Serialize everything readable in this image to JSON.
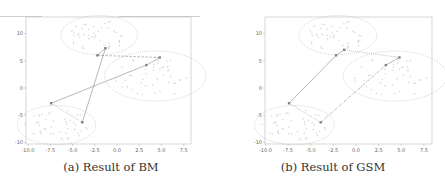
{
  "figure": {
    "captions": [
      "(a) Result of BM",
      "(b) Result of GSM"
    ]
  },
  "chart_data": [
    {
      "type": "scatter",
      "title": "(a) Result of BM",
      "xlabel": "",
      "ylabel": "",
      "xlim": [
        -10.5,
        8.2
      ],
      "ylim": [
        -10.2,
        13
      ],
      "xticks": [
        -10.0,
        -7.5,
        -5.0,
        -2.5,
        0.0,
        2.5,
        5.0,
        7.5
      ],
      "xtick_labels": [
        "-10.0",
        "-7.5",
        "-5.0",
        "-2.5",
        "0.0",
        "2.5",
        "5.0",
        "7.5"
      ],
      "yticks": [
        -10,
        -5,
        0,
        5,
        10
      ],
      "ytick_labels": [
        "-10",
        "-5",
        "0",
        "5",
        "10"
      ],
      "grid": false,
      "clusters": [
        {
          "center": [
            -6.8,
            -6.8
          ],
          "rx": 4.4,
          "ry": 3.6
        },
        {
          "center": [
            -2.0,
            9.7
          ],
          "rx": 4.3,
          "ry": 3.6
        },
        {
          "center": [
            4.3,
            2.2
          ],
          "rx": 5.7,
          "ry": 4.6
        }
      ],
      "markers": [
        {
          "x": -7.4,
          "y": -2.8
        },
        {
          "x": -3.9,
          "y": -6.3
        },
        {
          "x": -2.2,
          "y": 6.0
        },
        {
          "x": -1.3,
          "y": 7.3
        },
        {
          "x": 3.3,
          "y": 4.2
        },
        {
          "x": 4.8,
          "y": 5.6
        }
      ],
      "edges": [
        {
          "from": 0,
          "to": 1,
          "style": "dotted"
        },
        {
          "from": 1,
          "to": 3,
          "style": "solid"
        },
        {
          "from": 2,
          "to": 3,
          "style": "solid"
        },
        {
          "from": 2,
          "to": 5,
          "style": "dashed"
        },
        {
          "from": 5,
          "to": 4,
          "style": "solid"
        },
        {
          "from": 4,
          "to": 0,
          "style": "solid"
        }
      ]
    },
    {
      "type": "scatter",
      "title": "(b) Result of GSM",
      "xlabel": "",
      "ylabel": "",
      "xlim": [
        -10.5,
        8.2
      ],
      "ylim": [
        -10.2,
        13
      ],
      "xticks": [
        -10.0,
        -7.5,
        -5.0,
        -2.5,
        0.0,
        2.5,
        5.0,
        7.5
      ],
      "xtick_labels": [
        "-10.0",
        "-7.5",
        "-5.0",
        "-2.5",
        "0.0",
        "2.5",
        "5.0",
        "7.5"
      ],
      "yticks": [
        -10,
        -5,
        0,
        5,
        10
      ],
      "ytick_labels": [
        "-10",
        "-5",
        "0",
        "5",
        "10"
      ],
      "grid": false,
      "clusters": [
        {
          "center": [
            -6.8,
            -6.8
          ],
          "rx": 4.4,
          "ry": 3.6
        },
        {
          "center": [
            -2.0,
            9.7
          ],
          "rx": 4.3,
          "ry": 3.6
        },
        {
          "center": [
            4.3,
            2.2
          ],
          "rx": 5.7,
          "ry": 4.6
        }
      ],
      "markers": [
        {
          "x": -7.4,
          "y": -2.8
        },
        {
          "x": -3.9,
          "y": -6.3
        },
        {
          "x": -2.2,
          "y": 6.0
        },
        {
          "x": -1.3,
          "y": 7.0
        },
        {
          "x": 3.3,
          "y": 4.2
        },
        {
          "x": 4.8,
          "y": 5.6
        }
      ],
      "edges": [
        {
          "from": 0,
          "to": 1,
          "style": "dotted"
        },
        {
          "from": 1,
          "to": 4,
          "style": "dashdot"
        },
        {
          "from": 4,
          "to": 5,
          "style": "solid"
        },
        {
          "from": 5,
          "to": 3,
          "style": "dotted"
        },
        {
          "from": 3,
          "to": 2,
          "style": "solid"
        },
        {
          "from": 2,
          "to": 0,
          "style": "solid"
        }
      ]
    }
  ]
}
